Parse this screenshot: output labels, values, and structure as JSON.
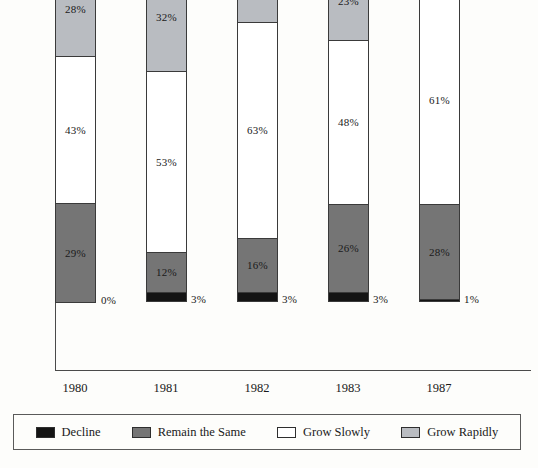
{
  "chart_data": {
    "type": "bar",
    "subtype": "stacked-percentage",
    "title": "",
    "xlabel": "",
    "ylabel": "",
    "ylim": [
      0,
      100
    ],
    "grid": false,
    "legend_position": "bottom",
    "categories": [
      "1980",
      "1981",
      "1982",
      "1983",
      "1987"
    ],
    "stack_order_bottom_to_top": [
      "Decline",
      "Remain the Same",
      "Grow Slowly",
      "Grow Rapidly"
    ],
    "series": [
      {
        "name": "Decline",
        "color": "#141414",
        "values": [
          0,
          3,
          3,
          3,
          1
        ],
        "labels": [
          "0%",
          "3%",
          "3%",
          "3%",
          "1%"
        ]
      },
      {
        "name": "Remain the Same",
        "color": "#757575",
        "values": [
          29,
          12,
          16,
          26,
          28
        ],
        "labels": [
          "29%",
          "12%",
          "16%",
          "26%",
          "28%"
        ]
      },
      {
        "name": "Grow Slowly",
        "color": "#ffffff",
        "values": [
          43,
          53,
          63,
          48,
          61
        ],
        "labels": [
          "43%",
          "53%",
          "63%",
          "48%",
          "61%"
        ]
      },
      {
        "name": "Grow Rapidly",
        "color": "#b9bcc1",
        "values": [
          28,
          32,
          18,
          23,
          10
        ],
        "labels": [
          "28%",
          "32%",
          "18%",
          "23%",
          "10%"
        ]
      }
    ]
  },
  "legend": {
    "items": [
      {
        "label": "Decline",
        "color": "#141414"
      },
      {
        "label": "Remain the Same",
        "color": "#757575"
      },
      {
        "label": "Grow Slowly",
        "color": "#ffffff"
      },
      {
        "label": "Grow Rapidly",
        "color": "#b9bcc1"
      }
    ]
  },
  "axis": {
    "tick_labels": [
      "1980",
      "1981",
      "1982",
      "1983",
      "1987"
    ]
  }
}
